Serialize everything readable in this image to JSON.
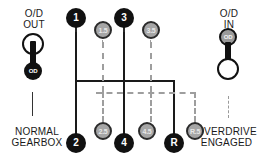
{
  "diagram": {
    "colors": {
      "primary_node": "#111111",
      "half_node": "#a6a6a6",
      "half_node_border": "#2b2b2b",
      "gate_solid": "#1a1a1a",
      "gate_dashed": "#9e9e9e",
      "text": "#1a1a1a",
      "background": "#ffffff"
    }
  },
  "left_lever": {
    "label_line1": "O/D",
    "label_line2": "OUT",
    "knob_text": "OD",
    "caption_line1": "NORMAL",
    "caption_line2": "GEARBOX",
    "position": "down",
    "top_knob": "open-circle",
    "bottom_knob": "black-od-circle"
  },
  "right_lever": {
    "label_line1": "O/D",
    "label_line2": "IN",
    "knob_text": "OD",
    "caption_line1": "OVERDRIVE",
    "caption_line2": "ENGAGED",
    "position": "up",
    "top_knob": "gray-od-circle",
    "bottom_knob": "open-circle"
  },
  "gear_nodes": {
    "top_row": [
      {
        "label": "1",
        "kind": "primary"
      },
      {
        "label": "1.5",
        "kind": "half"
      },
      {
        "label": "3",
        "kind": "primary"
      },
      {
        "label": "3.5",
        "kind": "half"
      }
    ],
    "bottom_row": [
      {
        "label": "2",
        "kind": "primary"
      },
      {
        "label": "2.5",
        "kind": "half"
      },
      {
        "label": "4",
        "kind": "primary"
      },
      {
        "label": "4.5",
        "kind": "half"
      },
      {
        "label": "R",
        "kind": "primary"
      },
      {
        "label": "R.5",
        "kind": "half"
      }
    ]
  },
  "legend": {
    "solid_meaning": "normal gearbox gate",
    "dashed_meaning": "overdrive engaged gate"
  }
}
